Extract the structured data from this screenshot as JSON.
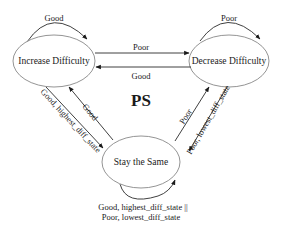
{
  "diagram": {
    "title": "PS",
    "nodes": [
      {
        "id": "increase",
        "label": "Increase Difficulty",
        "cx": 54,
        "cy": 61,
        "rx": 41,
        "ry": 26
      },
      {
        "id": "decrease",
        "label": "Decrease Difficulty",
        "cx": 229,
        "cy": 61,
        "rx": 40,
        "ry": 26
      },
      {
        "id": "stay",
        "label": "Stay the Same",
        "cx": 141,
        "cy": 162,
        "rx": 39,
        "ry": 26
      }
    ],
    "edges": [
      {
        "id": "increase-self",
        "from": "increase",
        "to": "increase",
        "label": "Good"
      },
      {
        "id": "decrease-self",
        "from": "decrease",
        "to": "decrease",
        "label": "Poor"
      },
      {
        "id": "increase-to-decrease",
        "from": "increase",
        "to": "decrease",
        "label": "Poor"
      },
      {
        "id": "decrease-to-increase",
        "from": "decrease",
        "to": "increase",
        "label": "Good"
      },
      {
        "id": "increase-to-stay",
        "from": "increase",
        "to": "stay",
        "label": "Good, highest_diff_state"
      },
      {
        "id": "stay-to-increase",
        "from": "stay",
        "to": "increase",
        "label": "Good"
      },
      {
        "id": "stay-to-decrease",
        "from": "stay",
        "to": "decrease",
        "label": "Poor"
      },
      {
        "id": "decrease-to-stay",
        "from": "decrease",
        "to": "stay",
        "label": "Poor, lowest_diff_state"
      },
      {
        "id": "stay-self",
        "from": "stay",
        "to": "stay",
        "label_line1": "Good, highest_diff_state ||",
        "label_line2": "Poor, lowest_diff_state"
      }
    ]
  }
}
